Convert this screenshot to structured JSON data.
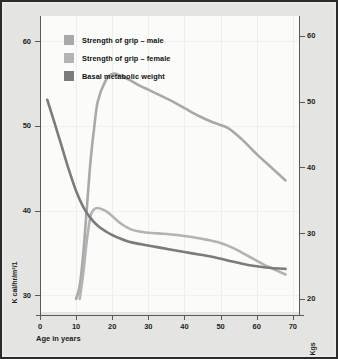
{
  "chart_data": {
    "type": "line",
    "title": "",
    "xlabel": "Age in years",
    "ylabel_left": "K cal/hr/m²/1",
    "ylabel_right": "Kgs",
    "xlim": [
      0,
      72
    ],
    "ylim_left": [
      28,
      63
    ],
    "ylim_right": [
      18,
      63
    ],
    "grid": true,
    "legend_position": "top-left",
    "xticks": [
      "0",
      "10",
      "20",
      "30",
      "40",
      "50",
      "60",
      "70"
    ],
    "xtick_values": [
      0,
      10,
      20,
      30,
      40,
      50,
      60,
      70
    ],
    "yticks_left": [
      "30",
      "40",
      "50",
      "60"
    ],
    "ytick_values_left": [
      30,
      40,
      50,
      60
    ],
    "yticks_right": [
      "20",
      "30",
      "40",
      "50",
      "60"
    ],
    "ytick_values_right": [
      20,
      30,
      40,
      50,
      60
    ],
    "series": [
      {
        "name": "Strength of grip – male",
        "color": "#a9a9a9",
        "axis": "right",
        "x": [
          10,
          11,
          12,
          13,
          14,
          15,
          16,
          18,
          20,
          22,
          25,
          28,
          30,
          33,
          36,
          40,
          44,
          48,
          52,
          56,
          60,
          64,
          68
        ],
        "values": [
          20,
          22,
          27,
          34,
          41,
          46,
          50,
          53,
          54.2,
          54,
          53.2,
          52.3,
          51.8,
          51,
          50.2,
          49,
          47.8,
          46.8,
          46,
          44.2,
          42,
          40,
          38
        ]
      },
      {
        "name": "Strength of grip – female",
        "color": "#b3b3b3",
        "axis": "right",
        "x": [
          11,
          12,
          13,
          14,
          15,
          16,
          18,
          20,
          22,
          25,
          28,
          31,
          34,
          38,
          42,
          46,
          50,
          54,
          58,
          62,
          66,
          68
        ],
        "values": [
          20,
          24,
          29,
          32.6,
          33.6,
          33.8,
          33.4,
          32.6,
          31.6,
          30.6,
          30.2,
          30,
          29.9,
          29.7,
          29.4,
          29,
          28.5,
          27.6,
          26.4,
          25.2,
          24.2,
          23.7
        ]
      },
      {
        "name": "Basal metabolic weight",
        "color": "#7b7b7b",
        "axis": "left",
        "x": [
          2,
          4,
          6,
          8,
          10,
          12,
          14,
          16,
          18,
          20,
          24,
          28,
          32,
          36,
          40,
          44,
          48,
          52,
          56,
          60,
          64,
          68
        ],
        "values": [
          53.1,
          50.4,
          47.6,
          44.8,
          42.3,
          40.4,
          39.1,
          38.2,
          37.6,
          37.1,
          36.4,
          36.0,
          35.7,
          35.4,
          35.1,
          34.8,
          34.5,
          34.1,
          33.7,
          33.4,
          33.2,
          33.1
        ]
      }
    ]
  },
  "legend": {
    "items": [
      {
        "label": "Strength of grip – male",
        "color": "#a9a9a9"
      },
      {
        "label": "Strength of grip – female",
        "color": "#b3b3b3"
      },
      {
        "label": "Basal metabolic weight",
        "color": "#7b7b7b"
      }
    ]
  },
  "axes": {
    "x_title": "Age in years",
    "y_left_title": "K cal/hr/m²/1",
    "y_right_title": "Kgs"
  }
}
